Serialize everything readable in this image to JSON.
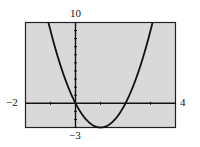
{
  "chart_data": {
    "type": "line",
    "title": "",
    "xlabel": "",
    "ylabel": "",
    "xlim": [
      -2,
      4
    ],
    "ylim": [
      -3,
      10
    ],
    "window_labels": {
      "xmin": "−2",
      "xmax": "4",
      "ymin": "−3",
      "ymax": "10"
    },
    "x_tick_step": 1,
    "y_tick_step": 1,
    "grid": false,
    "series": [
      {
        "name": "y = 3x² − 6x",
        "function": "3x^2 - 6x",
        "x": [
          -1.08,
          -1,
          -0.5,
          0,
          0.5,
          1,
          1.5,
          2,
          2.5,
          3,
          3.08
        ],
        "y": [
          10,
          9,
          3.75,
          0,
          -2.25,
          -3,
          -2.25,
          0,
          3.75,
          9,
          10
        ]
      }
    ],
    "colors": {
      "screen_background": "#d9d9d9",
      "curve": "#111111",
      "axes": "#111111",
      "frame": "#222222"
    }
  }
}
